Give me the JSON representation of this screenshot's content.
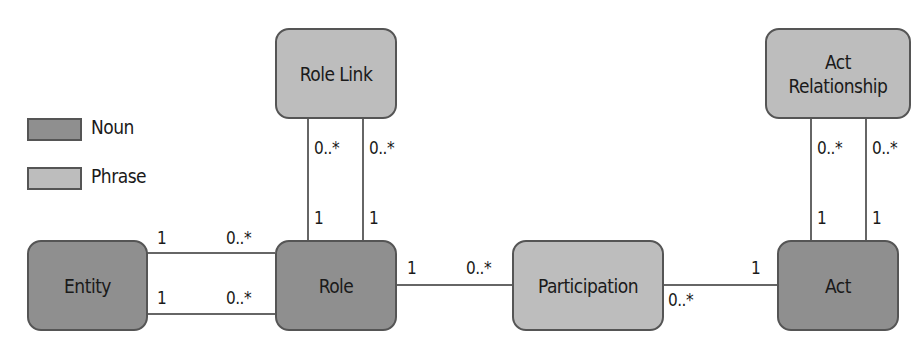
{
  "legend": {
    "items": [
      {
        "label": "Noun",
        "color": "#8f8f8f"
      },
      {
        "label": "Phrase",
        "color": "#bdbdbd"
      }
    ]
  },
  "nodes": {
    "role_link": {
      "label": "Role Link",
      "kind": "Phrase"
    },
    "act_relationship": {
      "line1": "Act",
      "line2": "Relationship",
      "kind": "Phrase"
    },
    "entity": {
      "label": "Entity",
      "kind": "Noun"
    },
    "role": {
      "label": "Role",
      "kind": "Noun"
    },
    "participation": {
      "label": "Participation",
      "kind": "Phrase"
    },
    "act": {
      "label": "Act",
      "kind": "Noun"
    }
  },
  "edges": {
    "entity_role_top": {
      "from_mult": "1",
      "to_mult": "0..*"
    },
    "entity_role_bottom": {
      "from_mult": "1",
      "to_mult": "0..*"
    },
    "role_participation": {
      "from_mult": "1",
      "to_mult": "0..*"
    },
    "participation_act": {
      "from_mult": "0..*",
      "to_mult": "1"
    },
    "rolelink_role_left": {
      "top_mult": "0..*",
      "bottom_mult": "1"
    },
    "rolelink_role_right": {
      "top_mult": "0..*",
      "bottom_mult": "1"
    },
    "actrel_act_left": {
      "top_mult": "0..*",
      "bottom_mult": "1"
    },
    "actrel_act_right": {
      "top_mult": "0..*",
      "bottom_mult": "1"
    }
  }
}
